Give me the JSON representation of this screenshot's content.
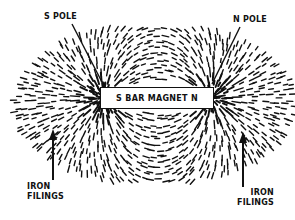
{
  "diagram": {
    "magnet": {
      "label": "S BAR MAGNET N",
      "left_pole": "S",
      "right_pole": "N"
    },
    "labels": {
      "s_pole": "S POLE",
      "n_pole": "N POLE",
      "iron_filings_left_line1": "IRON",
      "iron_filings_left_line2": "FILINGS",
      "iron_filings_right_line1": "IRON",
      "iron_filings_right_line2": "FILINGS"
    },
    "colors": {
      "ink": "#111111",
      "background": "#ffffff"
    }
  }
}
